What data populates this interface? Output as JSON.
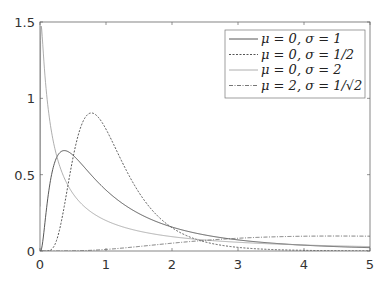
{
  "chart_data": {
    "type": "line",
    "title": "",
    "xlabel": "",
    "ylabel": "",
    "xlim": [
      0,
      5
    ],
    "ylim": [
      0,
      1.5
    ],
    "xticks": [
      "0",
      "1",
      "2",
      "3",
      "4",
      "5"
    ],
    "yticks": [
      "0",
      "0.5",
      "1",
      "1.5"
    ],
    "grid": false,
    "legend_position": "upper right",
    "series": [
      {
        "name": "μ = 0, σ = 1",
        "mu": 0,
        "sigma": 1,
        "style": "solid",
        "color": "#444444"
      },
      {
        "name": "μ = 0, σ = 1/2",
        "mu": 0,
        "sigma": 0.5,
        "style": "dotted",
        "color": "#555555"
      },
      {
        "name": "μ = 0, σ = 2",
        "mu": 0,
        "sigma": 2,
        "style": "solid-light",
        "color": "#999999"
      },
      {
        "name": "μ = 2, σ = 1/√2",
        "mu": 2,
        "sigma": 0.7071,
        "style": "dashdot",
        "color": "#666666"
      }
    ],
    "x": [
      0.25,
      0.5,
      1,
      1.5,
      2,
      3,
      4,
      5
    ],
    "values": {
      "mu0_s1": [
        0.53,
        0.63,
        0.4,
        0.25,
        0.16,
        0.07,
        0.03,
        0.02
      ],
      "mu0_s05": [
        0.12,
        0.69,
        0.8,
        0.37,
        0.16,
        0.03,
        0.01,
        0.0
      ],
      "mu0_s2": [
        0.81,
        0.59,
        0.4,
        0.3,
        0.23,
        0.16,
        0.12,
        0.09
      ],
      "mu2_s0707": [
        0.0,
        0.0,
        0.01,
        0.02,
        0.04,
        0.07,
        0.09,
        0.1
      ]
    }
  }
}
